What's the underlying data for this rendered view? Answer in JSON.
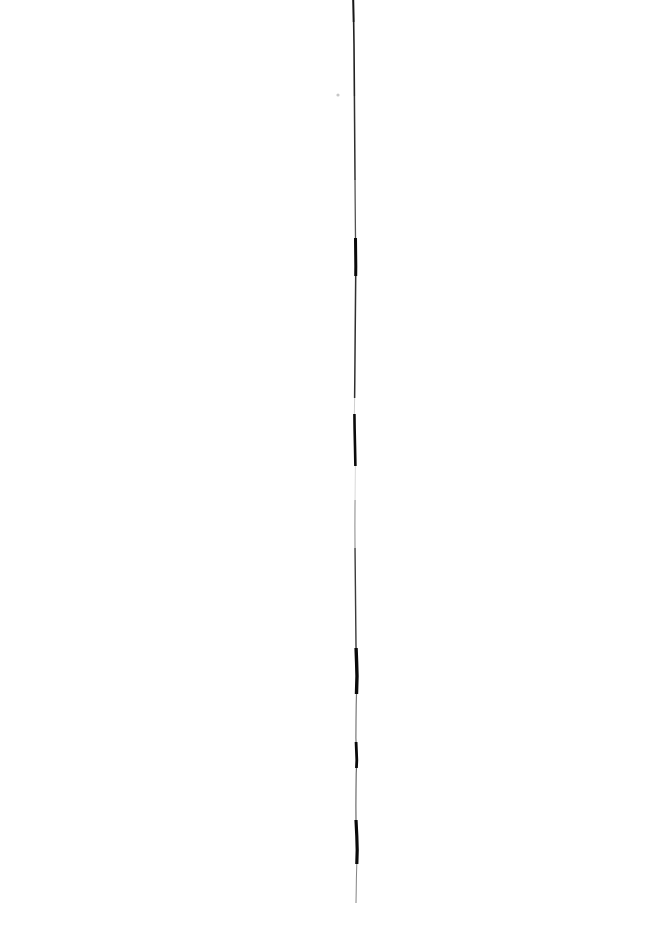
{
  "image": {
    "kind": "scanned-line-artifact",
    "width": 664,
    "height": 928,
    "background_color": "#ffffff",
    "ink_color": "#000000",
    "description": "A single near-vertical hand-drawn ink stroke scanned on a blank white page",
    "alt_text": "Thin black vertical ink line running down the middle of a white page"
  },
  "stroke": {
    "name": "vertical-ink-stroke",
    "color": "#0a0a0a",
    "start_y": 0,
    "end_y": 903,
    "mean_x": 355,
    "min_x": 350,
    "max_x": 360,
    "path": "M353.2,0 L353.6,18 L354.0,44 L354.2,70 L354.4,96 L354.6,122 L354.8,150 L355.0,178 L355.2,204 L355.4,228 L355.6,248 L355.8,266 L355.6,288 L355.4,310 L355.2,332 L355.0,356 L354.8,380 L354.6,400 L354.4,412 L354.6,428 L355.0,446 L355.4,466 L355.2,486 L355.0,506 L354.9,526 L355.0,546 L355.2,566 L355.4,586 L355.6,606 L355.8,626 L356.0,646 L356.6,662 L357.0,676 L356.6,690 L356.2,706 L356.0,722 L355.9,738 L356.4,750 L356.8,760 L356.2,774 L356.0,790 L355.9,806 L356.0,820 L356.8,836 L357.2,850 L356.8,864 L356.4,878 L356.2,892 L356.0,903",
    "segments": [
      {
        "name": "top-taper",
        "y_start": 0,
        "y_end": 22,
        "width": 2.0,
        "opacity": 0.95
      },
      {
        "name": "upper-thin",
        "y_start": 22,
        "y_end": 96,
        "width": 1.6,
        "opacity": 0.9
      },
      {
        "name": "upper-mid",
        "y_start": 96,
        "y_end": 180,
        "width": 1.5,
        "opacity": 0.85
      },
      {
        "name": "upper-fade",
        "y_start": 180,
        "y_end": 238,
        "width": 1.3,
        "opacity": 0.7
      },
      {
        "name": "blob-upper",
        "y_start": 238,
        "y_end": 276,
        "width": 3.0,
        "opacity": 1.0
      },
      {
        "name": "mid-thin",
        "y_start": 276,
        "y_end": 398,
        "width": 1.5,
        "opacity": 0.85
      },
      {
        "name": "gap-upper",
        "y_start": 398,
        "y_end": 414,
        "width": 0.8,
        "opacity": 0.25
      },
      {
        "name": "blob-mid",
        "y_start": 414,
        "y_end": 466,
        "width": 2.6,
        "opacity": 1.0
      },
      {
        "name": "gap-mid",
        "y_start": 466,
        "y_end": 500,
        "width": 0.8,
        "opacity": 0.2
      },
      {
        "name": "faint-lower-mid",
        "y_start": 500,
        "y_end": 548,
        "width": 1.1,
        "opacity": 0.45
      },
      {
        "name": "lower-thin",
        "y_start": 548,
        "y_end": 648,
        "width": 1.4,
        "opacity": 0.8
      },
      {
        "name": "blob-lower",
        "y_start": 648,
        "y_end": 694,
        "width": 3.4,
        "opacity": 1.0
      },
      {
        "name": "lower-fade",
        "y_start": 694,
        "y_end": 742,
        "width": 1.2,
        "opacity": 0.55
      },
      {
        "name": "hook-blob",
        "y_start": 742,
        "y_end": 768,
        "width": 2.8,
        "opacity": 1.0
      },
      {
        "name": "tail-thin",
        "y_start": 768,
        "y_end": 820,
        "width": 1.2,
        "opacity": 0.6
      },
      {
        "name": "blob-bottom",
        "y_start": 820,
        "y_end": 864,
        "width": 3.2,
        "opacity": 1.0
      },
      {
        "name": "bottom-taper",
        "y_start": 864,
        "y_end": 903,
        "width": 1.0,
        "opacity": 0.5
      }
    ]
  },
  "speck": {
    "name": "ink-speck",
    "x": 338,
    "y": 95,
    "radius": 1.6,
    "opacity": 0.22,
    "color": "#000000"
  }
}
